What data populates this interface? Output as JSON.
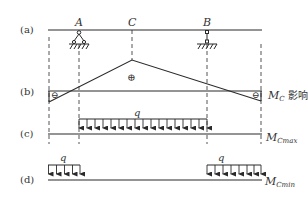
{
  "figure": {
    "row_labels": {
      "a": "(a)",
      "b": "(b)",
      "c": "(c)",
      "d": "(d)"
    },
    "points": {
      "A": "A",
      "C": "C",
      "B": "B"
    },
    "signs": {
      "positive": "⊕",
      "negative_left": "⊖",
      "negative_right": "⊖"
    },
    "influence_line_label": {
      "symbol": "M",
      "subscript": "C",
      "text": " 影响线"
    },
    "load_c": {
      "label": "q",
      "result_symbol": "M",
      "result_subscript": "Cmax"
    },
    "load_d": {
      "left_label": "q",
      "right_label": "q",
      "result_symbol": "M",
      "result_subscript": "Cmin"
    },
    "colors": {
      "line": "#2a2a2a",
      "dash": "#555555",
      "text": "#333333"
    }
  }
}
